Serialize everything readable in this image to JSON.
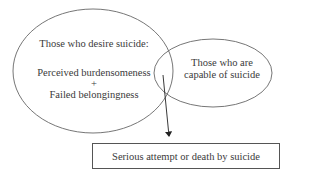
{
  "desire_circle": {
    "title": "Those who desire suicide:",
    "factor_1": "Perceived burdensomeness",
    "plus": "+",
    "factor_2": "Failed belongingness"
  },
  "capability_circle": {
    "line_1": "Those who are",
    "line_2": "capable of suicide"
  },
  "outcome_box": {
    "label": "Serious attempt or death by suicide"
  }
}
